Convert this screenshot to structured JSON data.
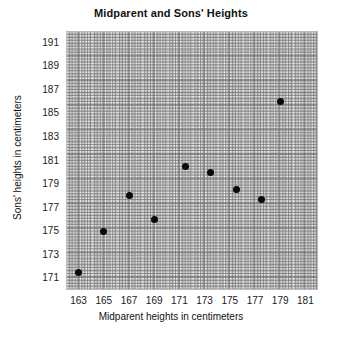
{
  "chart_data": {
    "type": "scatter",
    "title": "Midparent and Sons' Heights",
    "xlabel": "Midparent heights in centimeters",
    "ylabel": "Sons' heights in centimeters",
    "xlim": [
      162,
      182
    ],
    "ylim": [
      170,
      192
    ],
    "xticks": [
      163,
      165,
      167,
      169,
      171,
      173,
      175,
      177,
      179,
      181
    ],
    "yticks": [
      171,
      173,
      175,
      177,
      179,
      181,
      183,
      185,
      187,
      189,
      191
    ],
    "grid": true,
    "legend": null,
    "series": [
      {
        "name": "Midparent vs son height",
        "marker": "filled-circle",
        "color": "#0a0a0a",
        "points": [
          {
            "x": 163.0,
            "y": 171.5
          },
          {
            "x": 165.0,
            "y": 175.0
          },
          {
            "x": 167.0,
            "y": 178.0
          },
          {
            "x": 169.0,
            "y": 176.0
          },
          {
            "x": 171.5,
            "y": 180.5
          },
          {
            "x": 173.5,
            "y": 180.0
          },
          {
            "x": 175.5,
            "y": 178.5
          },
          {
            "x": 177.5,
            "y": 177.7
          },
          {
            "x": 179.0,
            "y": 186.0
          }
        ]
      }
    ]
  }
}
